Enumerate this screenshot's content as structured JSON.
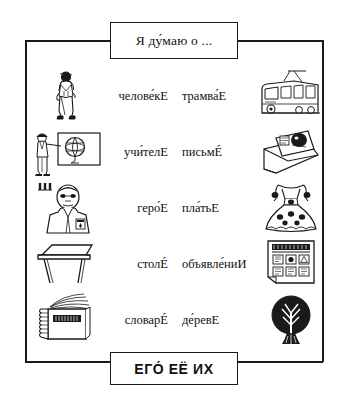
{
  "worksheet": {
    "header_box": {
      "text": "Я ду́маю о ...",
      "label": "ya-dumayu-o"
    },
    "footer_box": {
      "text": "ЕГО́  ЕЁ  ИХ",
      "label": "ego-eyo-ikh"
    },
    "rows": [
      {
        "left_icon": "man-standing-icon",
        "left_word": "челове́кЕ",
        "right_word": "трамва́Е",
        "right_icon": "tram-icon"
      },
      {
        "left_icon": "teacher-at-blackboard-icon",
        "left_word": "учи́телЕ",
        "right_word": "письмÉ",
        "right_icon": "envelope-letter-icon"
      },
      {
        "left_icon": "hero-with-medal-icon",
        "left_word": "геро́Е",
        "right_word": "пла́тьЕ",
        "right_icon": "dress-icon"
      },
      {
        "left_icon": "table-icon",
        "left_word": "столÉ",
        "right_word": "объявле́ниИ",
        "right_icon": "notice-board-icon"
      },
      {
        "left_icon": "dictionary-book-icon",
        "left_word": "словарÉ",
        "right_word": "де́ревЕ",
        "right_icon": "tree-icon"
      }
    ]
  },
  "colors": {
    "ink": "#1a1a1a",
    "paper": "#ffffff"
  }
}
